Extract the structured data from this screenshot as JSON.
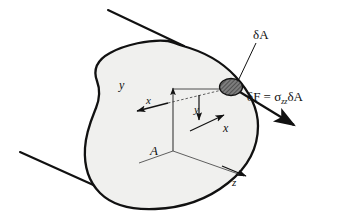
{
  "figure": {
    "type": "engineering-diagram",
    "background_color": "#ffffff",
    "section_fill_color": "#f0f0ee",
    "line_color": "#111111",
    "element_fill_color": "#6f6f6f"
  },
  "labels": {
    "delta_area": "δA",
    "axis_y_main": "y",
    "axis_x_left": "x",
    "axis_y_small": "y",
    "axis_x_right": "x",
    "axis_z": "z",
    "area": "A",
    "force_prefix": "δF",
    "force_equals": " = ",
    "force_sigma": "σ",
    "force_sigma_sub": "zz",
    "force_suffix": "δA",
    "force_full": "δF = σzz δA"
  },
  "geometry": {
    "beam_edge_top": {
      "x1": 108,
      "y1": 10,
      "x2": 183,
      "y2": 46
    },
    "beam_edge_bottom": {
      "x1": 20,
      "y1": 152,
      "x2": 128,
      "y2": 201
    },
    "element_center": {
      "x": 231,
      "y": 88
    },
    "element_rx": 11,
    "element_ry": 8,
    "force_arrow_tip": {
      "x": 292,
      "y": 124
    },
    "axis_origin": {
      "x": 173,
      "y": 151
    },
    "axis_y_top": {
      "x": 173,
      "y": 87
    },
    "axis_z_tip": {
      "x": 243,
      "y": 175
    },
    "axis_x_right_tip": {
      "x": 222,
      "y": 117
    },
    "axis_x_left_tip": {
      "x": 134,
      "y": 110
    },
    "leader_delta_a": {
      "x1": 257,
      "y1": 42,
      "x2": 238,
      "y2": 80
    }
  }
}
